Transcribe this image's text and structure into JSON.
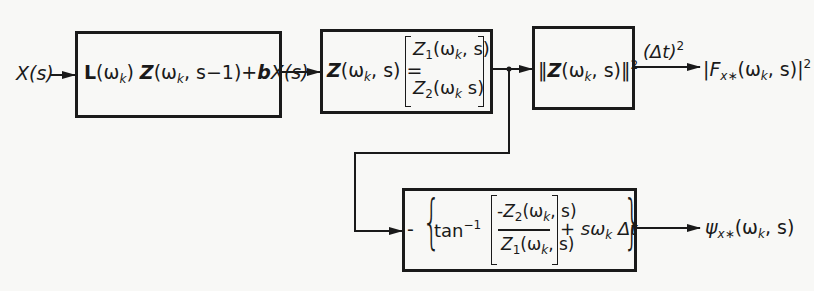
{
  "diagram": {
    "input": {
      "label": "X(s)"
    },
    "blocks": [
      {
        "id": "recursion",
        "expr": {
          "L": "L",
          "L_arg": "(ω",
          "L_sub": "k",
          "L_close": ")",
          "Z": "Z",
          "Z_arg": "(ω",
          "Z_sub": "k",
          "Z_rest": ", s−1)+",
          "b": "b",
          "bX": "X(s)"
        }
      },
      {
        "id": "vector",
        "lhs": {
          "Z": "Z",
          "arg": "(ω",
          "sub": "k",
          "rest": ", s) ="
        },
        "rows": [
          {
            "Z": "Z",
            "zsub": "1",
            "arg": "(ω",
            "sub": "k",
            "rest": ", s)"
          },
          {
            "Z": "Z",
            "zsub": "2",
            "arg": "(ω",
            "sub": "k",
            "rest": " s)"
          }
        ]
      },
      {
        "id": "norm",
        "expr": {
          "open": "‖",
          "Z": "Z",
          "arg": "(ω",
          "sub": "k",
          "rest": ", s)‖",
          "pow": "2"
        }
      },
      {
        "id": "phase",
        "expr": {
          "minus": "-",
          "tan": "tan",
          "inv": "−1",
          "num": {
            "neg": "-",
            "Z": "Z",
            "zsub": "2",
            "arg": "(ω",
            "sub": "k",
            "rest": ", s)"
          },
          "den": {
            "Z": "Z",
            "zsub": "1",
            "arg": "(ω",
            "sub": "k",
            "rest": ", s)"
          },
          "plus": "+ sω",
          "psub": "k",
          "dt": " Δt"
        }
      }
    ],
    "edge_labels": {
      "scale": {
        "text": "(Δt)",
        "pow": "2"
      }
    },
    "outputs": {
      "power": {
        "pre": "|F",
        "sub": "x∗",
        "arg": "(ω",
        "asub": "k",
        "rest": ", s)|",
        "pow": "2"
      },
      "phase": {
        "pre": "ψ",
        "sub": "x∗",
        "arg": "(ω",
        "asub": "k",
        "rest": ", s)"
      }
    },
    "colors": {
      "ink": "#1a1a1a",
      "paper": "#f8f8f6"
    }
  }
}
